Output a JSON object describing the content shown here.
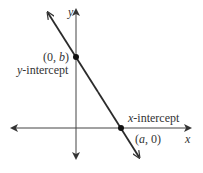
{
  "diagram": {
    "title": "",
    "axes": {
      "x_label": "x",
      "y_label": "y"
    },
    "line": {
      "description": "line with negative slope crossing both axes",
      "color": "#2b2b2b"
    },
    "points": [
      {
        "id": "y-intercept",
        "coord_label": "(0, b)",
        "coord_prefix": "(0, ",
        "coord_var": "b",
        "coord_suffix": ")",
        "name_var": "y",
        "name_rest": "-intercept"
      },
      {
        "id": "x-intercept",
        "coord_label": "(a, 0)",
        "coord_prefix": "(",
        "coord_var": "a",
        "coord_suffix": ", 0)",
        "name_var": "x",
        "name_rest": "-intercept"
      }
    ],
    "colors": {
      "axis": "#333333",
      "line": "#2b2b2b",
      "point": "#111111"
    }
  }
}
